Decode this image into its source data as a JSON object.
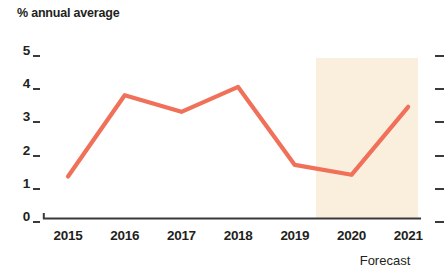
{
  "chart_data": {
    "type": "line",
    "title": "% annual average",
    "xlabel": "",
    "ylabel": "",
    "categories": [
      "2015",
      "2016",
      "2017",
      "2018",
      "2019",
      "2020",
      "2021"
    ],
    "x": [
      2015,
      2016,
      2017,
      2018,
      2019,
      2020,
      2021
    ],
    "values": [
      1.25,
      3.7,
      3.2,
      3.95,
      1.6,
      1.3,
      3.35
    ],
    "series": [
      {
        "name": "% annual average",
        "values": [
          1.25,
          3.7,
          3.2,
          3.95,
          1.6,
          1.3,
          3.35
        ],
        "color": "#F0705A"
      }
    ],
    "ylim": [
      0,
      5
    ],
    "yticks": [
      0,
      1,
      2,
      3,
      4,
      5
    ],
    "ytick_labels": [
      "0",
      "1",
      "2",
      "3",
      "4",
      "5"
    ],
    "grid": false,
    "legend": false,
    "annotations": [
      {
        "name": "forecast-shading",
        "label": "Forecast",
        "x_start": 2019.5,
        "x_end": 2021.2,
        "color": "#FAEEDC"
      }
    ],
    "line_color": "#F0705A",
    "axis_color": "#3a3a3a"
  },
  "axes": {
    "y_ticks": [
      {
        "value": 5,
        "label": "5"
      },
      {
        "value": 4,
        "label": "4"
      },
      {
        "value": 3,
        "label": "3"
      },
      {
        "value": 2,
        "label": "2"
      },
      {
        "value": 1,
        "label": "1"
      },
      {
        "value": 0,
        "label": "0"
      }
    ],
    "x_ticks": [
      {
        "value": 2015,
        "label": "2015"
      },
      {
        "value": 2016,
        "label": "2016"
      },
      {
        "value": 2017,
        "label": "2017"
      },
      {
        "value": 2018,
        "label": "2018"
      },
      {
        "value": 2019,
        "label": "2019"
      },
      {
        "value": 2020,
        "label": "2020"
      },
      {
        "value": 2021,
        "label": "2021"
      }
    ]
  },
  "header": {
    "title": "% annual average"
  },
  "footer": {
    "forecast_label": "Forecast"
  }
}
